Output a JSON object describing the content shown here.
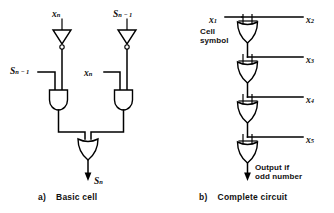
{
  "figure": {
    "background_color": "#ffffff",
    "ink_color": "#000000"
  },
  "panel_a": {
    "caption": "a)  Basic cell",
    "caption_letter": "a)",
    "caption_text": "Basic cell",
    "inputs": [
      {
        "name": "input-top-left",
        "base": "x",
        "subscript": "n",
        "full": "xₙ"
      },
      {
        "name": "input-top-right",
        "base": "S",
        "subscript": "n − 1",
        "full": "Sₙ₋₁"
      },
      {
        "name": "input-side-left",
        "base": "S",
        "subscript": "n − 1",
        "full": "Sₙ₋₁"
      },
      {
        "name": "input-side-right",
        "base": "x",
        "subscript": "n",
        "full": "xₙ"
      }
    ],
    "output": {
      "base": "S",
      "subscript": "n",
      "full": "Sₙ"
    },
    "gates": [
      {
        "type": "inverter",
        "name": "inverter-left"
      },
      {
        "type": "inverter",
        "name": "inverter-right"
      },
      {
        "type": "and",
        "name": "and-gate-left"
      },
      {
        "type": "and",
        "name": "and-gate-right"
      },
      {
        "type": "or",
        "name": "or-gate-output"
      }
    ]
  },
  "panel_b": {
    "caption": "b)  Complete circuit",
    "caption_letter": "b)",
    "caption_text": "Complete circuit",
    "cell_symbol_label_line1": "Cell",
    "cell_symbol_label_line2": "symbol",
    "output_label_line1": "Output if",
    "output_label_line2": "odd number",
    "left_input": {
      "base": "x",
      "subscript": "1",
      "full": "x₁"
    },
    "right_inputs": [
      {
        "base": "x",
        "subscript": "2",
        "full": "x₂"
      },
      {
        "base": "x",
        "subscript": "3",
        "full": "x₃"
      },
      {
        "base": "x",
        "subscript": "4",
        "full": "x₄"
      },
      {
        "base": "x",
        "subscript": "5",
        "full": "x₅"
      }
    ],
    "cells": [
      {
        "name": "cell-1"
      },
      {
        "name": "cell-2"
      },
      {
        "name": "cell-3"
      },
      {
        "name": "cell-4"
      }
    ]
  }
}
